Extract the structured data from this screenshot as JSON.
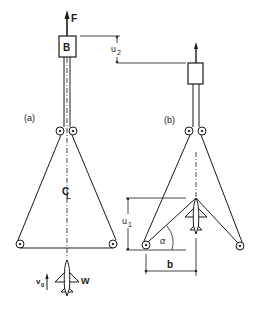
{
  "figure": {
    "panel_a": {
      "label": "(a)",
      "force_label": "F",
      "block_label": "B",
      "centerline_label": "C",
      "centerline_sub": "L",
      "velocity_label": "v",
      "velocity_sub": "0",
      "weight_label": "W"
    },
    "panel_b": {
      "label": "(b)",
      "height_label": "u",
      "height_sub": "1",
      "angle_label": "α",
      "width_label": "b"
    },
    "displacement": {
      "label": "u",
      "sub": "2"
    },
    "colors": {
      "ink": "#1a1a1a",
      "background": "#ffffff"
    }
  }
}
